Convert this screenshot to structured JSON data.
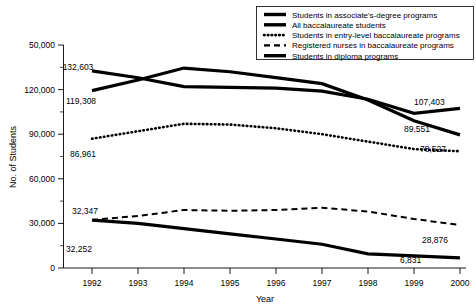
{
  "chart_data": {
    "type": "line",
    "title": "",
    "xlabel": "Year",
    "ylabel": "No. of Students",
    "x": [
      1992,
      1993,
      1994,
      1995,
      1996,
      1997,
      1998,
      1999,
      2000
    ],
    "xtick_labels": [
      "1992",
      "1993",
      "1994",
      "1995",
      "1996",
      "1997",
      "1998",
      "1999",
      "2000"
    ],
    "ytick_labels": [
      "50,000",
      "120,000",
      "90,000",
      "60,000",
      "30,000",
      "0"
    ],
    "ytick_values": [
      150000,
      120000,
      90000,
      60000,
      30000,
      0
    ],
    "ylim": [
      0,
      150000
    ],
    "ytick_interval": 30000,
    "yminor_interval": 15000,
    "grid": false,
    "legend_position": "top-right",
    "series": [
      {
        "name": "Students in associate's-degree programs",
        "style": "solid-thick",
        "values": [
          119308,
          126500,
          134500,
          132000,
          128000,
          124000,
          113000,
          99000,
          89551
        ],
        "start_label": "119,308",
        "end_label": "89,551"
      },
      {
        "name": "All baccalaureate students",
        "style": "solid-thick",
        "values": [
          132603,
          128000,
          122000,
          121500,
          121000,
          119000,
          113500,
          104000,
          107403
        ],
        "start_label": "132,603",
        "end_label": "107,403"
      },
      {
        "name": "Students in entry-level baccalaureate programs",
        "style": "dotted",
        "values": [
          86961,
          92000,
          97000,
          96500,
          94000,
          90000,
          85000,
          80000,
          78527
        ],
        "start_label": "86,961",
        "end_label": "78,527"
      },
      {
        "name": "Registered nurses in baccalaureate programs",
        "style": "dashed",
        "values": [
          32347,
          35000,
          39000,
          38500,
          39000,
          40500,
          38000,
          33000,
          28876
        ],
        "start_label": "32,347",
        "end_label": "28,876"
      },
      {
        "name": "Students in diploma programs",
        "style": "solid-thick",
        "values": [
          32252,
          30000,
          26500,
          23000,
          19500,
          16000,
          9500,
          8200,
          6831
        ],
        "start_label": "32,252",
        "end_label": "6,831"
      }
    ],
    "legend": [
      {
        "label": "Students in associate's-degree programs",
        "swatch": "solid"
      },
      {
        "label": "All baccalaureate students",
        "swatch": "solid"
      },
      {
        "label": "Students in entry-level baccalaureate programs",
        "swatch": "dotted"
      },
      {
        "label": "Registered nurses in baccalaureate programs",
        "swatch": "dashed"
      },
      {
        "label": "Students in diploma programs",
        "swatch": "solid"
      }
    ],
    "data_labels": [
      {
        "text": "132,603",
        "x": 78,
        "y": 70
      },
      {
        "text": "119,308",
        "x": 66,
        "y": 104
      },
      {
        "text": "86,961",
        "x": 70,
        "y": 157
      },
      {
        "text": "32,347",
        "x": 72,
        "y": 214
      },
      {
        "text": "32,252",
        "x": 66,
        "y": 252
      },
      {
        "text": "107,403",
        "x": 414,
        "y": 105
      },
      {
        "text": "89,551",
        "x": 408,
        "y": 132
      },
      {
        "text": "78,527",
        "x": 420,
        "y": 152
      },
      {
        "text": "28,876",
        "x": 424,
        "y": 243
      },
      {
        "text": "6,831",
        "x": 406,
        "y": 263
      }
    ]
  }
}
